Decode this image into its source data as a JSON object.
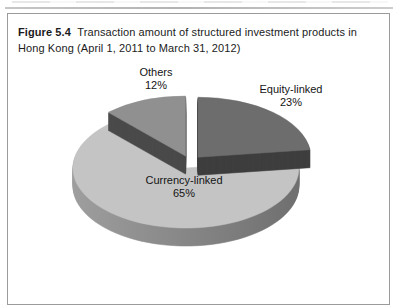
{
  "figure": {
    "label": "Figure 5.4",
    "caption": "Transaction amount of structured investment products in Hong Kong (April 1, 2011 to March 31, 2012)"
  },
  "chart_data": {
    "type": "pie",
    "style": "3d-exploded",
    "title": "Transaction amount of structured investment products in Hong Kong (April 1, 2011 to March 31, 2012)",
    "categories": [
      "Equity-linked",
      "Currency-linked",
      "Others"
    ],
    "values": [
      23,
      65,
      12
    ],
    "unit": "percent",
    "start_angle_deg": 0,
    "direction": "clockwise",
    "legend": "none (direct slice labels)",
    "slices": [
      {
        "label": "Equity-linked",
        "value": 23,
        "pct": "23%",
        "color_top": "#6d6d6d",
        "color_side": "#3e3e3e"
      },
      {
        "label": "Currency-linked",
        "value": 65,
        "pct": "65%",
        "color_top": "#c4c4c4",
        "color_side": "#9e9e9e",
        "color_side2": "#6f6f6f"
      },
      {
        "label": "Others",
        "value": 12,
        "pct": "12%",
        "color_top": "#909090",
        "color_side": "#4a4a4a"
      }
    ],
    "geometry": {
      "cx": 190,
      "cy": 162,
      "rx": 113,
      "ry": 60,
      "depth": 18,
      "explode": 12
    }
  }
}
